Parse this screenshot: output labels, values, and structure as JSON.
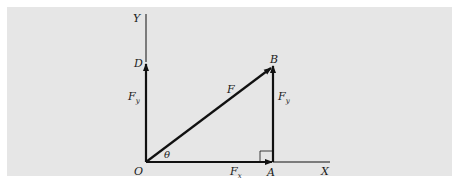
{
  "figure": {
    "background_color": "#e6e6e6",
    "stroke_color": "#111111",
    "labels": {
      "y_axis": "Y",
      "x_axis": "X",
      "point_d": "D",
      "point_b": "B",
      "point_o": "O",
      "point_a": "A",
      "vector_f": "F",
      "fy_left": "F",
      "fy_left_sub": "y",
      "fy_right": "F",
      "fy_right_sub": "y",
      "fx": "F",
      "fx_sub": "x",
      "angle": "θ"
    }
  }
}
